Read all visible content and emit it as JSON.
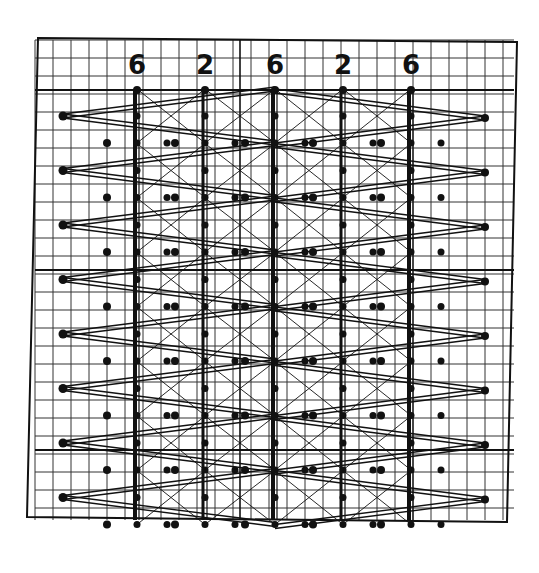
{
  "diagram": {
    "type": "lace pricking / grid pattern diagram",
    "column_labels": [
      "6",
      "2",
      "6",
      "2",
      "6"
    ],
    "column_x": [
      137,
      205,
      275,
      343,
      411
    ],
    "frame": {
      "top_left": [
        38,
        38
      ],
      "top_right": [
        517,
        42
      ],
      "bottom_right": [
        507,
        522
      ],
      "bottom_left": [
        27,
        517
      ]
    },
    "grid_spacing": 18,
    "zigzag": {
      "left_x": 63,
      "right_x": 485,
      "top_y": 90,
      "row_step": 54.5,
      "rows": 8
    },
    "colors": {
      "ink": "#111111",
      "paper": "#ffffff"
    }
  }
}
